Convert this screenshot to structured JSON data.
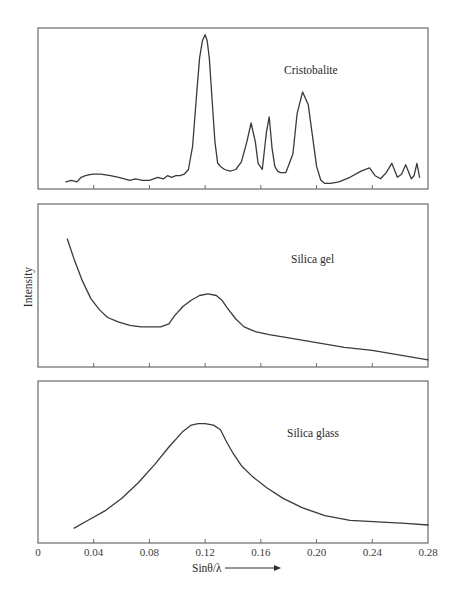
{
  "figure": {
    "ylabel": "Intensity",
    "xlabel": "Sinθ/λ",
    "xlabel_arrow": "right-arrow",
    "x_ticks": [
      "0",
      "0.04",
      "0.08",
      "0.12",
      "0.16",
      "0.20",
      "0.24",
      "0.28"
    ]
  },
  "chart_data": [
    {
      "type": "line",
      "title": "Cristobalite",
      "xlabel": "Sinθ/λ",
      "ylabel": "Intensity",
      "xlim": [
        0,
        0.28
      ],
      "ylim": [
        0,
        100
      ],
      "grid": false,
      "x": [
        0.02,
        0.024,
        0.028,
        0.031,
        0.034,
        0.039,
        0.045,
        0.052,
        0.058,
        0.062,
        0.066,
        0.07,
        0.075,
        0.08,
        0.086,
        0.09,
        0.093,
        0.096,
        0.099,
        0.102,
        0.105,
        0.108,
        0.111,
        0.114,
        0.116,
        0.118,
        0.12,
        0.1215,
        0.123,
        0.125,
        0.127,
        0.129,
        0.131,
        0.134,
        0.138,
        0.142,
        0.146,
        0.15,
        0.153,
        0.156,
        0.158,
        0.161,
        0.164,
        0.166,
        0.168,
        0.17,
        0.172,
        0.174,
        0.178,
        0.183,
        0.186,
        0.19,
        0.194,
        0.197,
        0.2,
        0.203,
        0.206,
        0.21,
        0.216,
        0.224,
        0.232,
        0.238,
        0.242,
        0.246,
        0.25,
        0.254,
        0.258,
        0.261,
        0.264,
        0.268,
        0.27,
        0.272,
        0.274
      ],
      "values": [
        2,
        3,
        2,
        5,
        6,
        7,
        7,
        6,
        5,
        4,
        3,
        4,
        3,
        3,
        5,
        4,
        6,
        5,
        6,
        6,
        7,
        10,
        25,
        60,
        82,
        93,
        97,
        93,
        82,
        55,
        28,
        14,
        12,
        10,
        9,
        10,
        15,
        28,
        40,
        28,
        14,
        10,
        34,
        44,
        24,
        12,
        9,
        8,
        8,
        20,
        46,
        60,
        52,
        32,
        12,
        3,
        1,
        1,
        2,
        5,
        9,
        11,
        6,
        4,
        8,
        14,
        5,
        7,
        13,
        4,
        6,
        14,
        5
      ],
      "peaks_approx": [
        {
          "x": 0.121,
          "rel_intensity": 97
        },
        {
          "x": 0.159,
          "rel_intensity": 42
        },
        {
          "x": 0.171,
          "rel_intensity": 44
        },
        {
          "x": 0.197,
          "rel_intensity": 60
        }
      ]
    },
    {
      "type": "line",
      "title": "Silica gel",
      "xlabel": "Sinθ/λ",
      "ylabel": "Intensity",
      "xlim": [
        0,
        0.28
      ],
      "ylim": [
        0,
        100
      ],
      "grid": false,
      "x": [
        0.021,
        0.026,
        0.032,
        0.038,
        0.044,
        0.05,
        0.058,
        0.066,
        0.074,
        0.082,
        0.088,
        0.094,
        0.098,
        0.104,
        0.11,
        0.116,
        0.122,
        0.128,
        0.132,
        0.136,
        0.142,
        0.148,
        0.156,
        0.166,
        0.18,
        0.2,
        0.22,
        0.24,
        0.26,
        0.28
      ],
      "values": [
        79,
        66,
        52,
        41,
        34,
        29,
        26,
        24,
        23,
        23,
        23,
        25,
        30,
        36,
        40,
        43,
        44,
        43,
        40,
        35,
        28,
        23,
        20,
        18,
        16,
        13,
        10,
        8,
        5,
        2
      ],
      "peaks_approx": [
        {
          "x": 0.122,
          "rel_intensity": 44
        }
      ]
    },
    {
      "type": "line",
      "title": "Silica glass",
      "xlabel": "Sinθ/λ",
      "ylabel": "Intensity",
      "xlim": [
        0,
        0.28
      ],
      "ylim": [
        0,
        100
      ],
      "grid": false,
      "x": [
        0.026,
        0.036,
        0.048,
        0.06,
        0.072,
        0.084,
        0.094,
        0.104,
        0.11,
        0.115,
        0.12,
        0.126,
        0.131,
        0.135,
        0.14,
        0.146,
        0.154,
        0.164,
        0.176,
        0.19,
        0.206,
        0.224,
        0.244,
        0.264,
        0.28
      ],
      "values": [
        7,
        12,
        18,
        26,
        36,
        48,
        59,
        69,
        73,
        74,
        74,
        73,
        70,
        63,
        55,
        47,
        40,
        33,
        26,
        20,
        15,
        12,
        11,
        10,
        9
      ],
      "peaks_approx": [
        {
          "x": 0.12,
          "rel_intensity": 74
        }
      ]
    }
  ]
}
